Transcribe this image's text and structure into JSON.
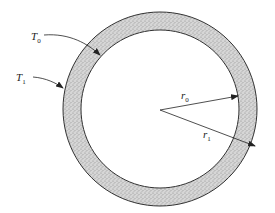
{
  "diagram": {
    "type": "annular cross-section",
    "center": [
      160,
      109
    ],
    "outer_radius": 97,
    "inner_radius": 79,
    "fill_pattern": "stippled",
    "colors": {
      "fill": "#cfcfcf",
      "stroke": "#333333"
    },
    "labels": {
      "T0": {
        "main": "T",
        "sub": "0"
      },
      "T1": {
        "main": "T",
        "sub": "1"
      },
      "r0": {
        "main": "r",
        "sub": "0"
      },
      "r1": {
        "main": "r",
        "sub": "1"
      }
    }
  }
}
